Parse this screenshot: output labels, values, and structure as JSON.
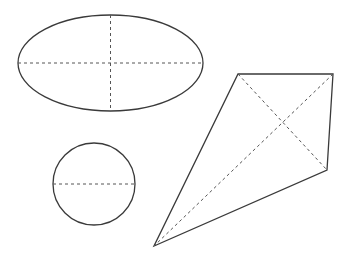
{
  "canvas": {
    "width": 344,
    "height": 259,
    "background": "#ffffff"
  },
  "style": {
    "stroke": "#3a3a3a",
    "dash_stroke": "#555555",
    "stroke_width": 1.3,
    "dash_width": 1,
    "dash_pattern": "3,3"
  },
  "shapes": {
    "ellipse": {
      "cx": 110.5,
      "cy": 63,
      "rx": 92.5,
      "ry": 48,
      "axes": [
        "horizontal",
        "vertical"
      ]
    },
    "circle": {
      "cx": 94,
      "cy": 184,
      "r": 41,
      "axes": [
        "horizontal-diameter"
      ]
    },
    "quadrilateral": {
      "vertices": [
        [
          238,
          74
        ],
        [
          333,
          74
        ],
        [
          327,
          170
        ],
        [
          154,
          246
        ]
      ],
      "diagonals": [
        [
          0,
          2
        ],
        [
          1,
          3
        ]
      ]
    }
  }
}
